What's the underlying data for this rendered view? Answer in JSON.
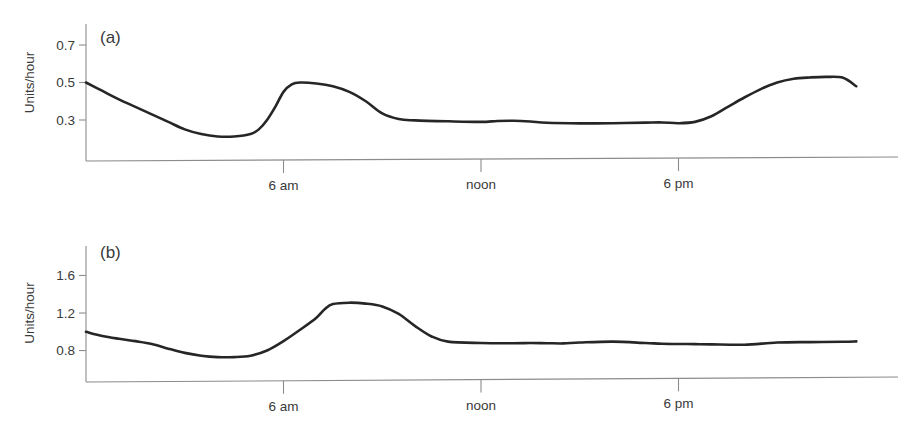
{
  "figure": {
    "width": 904,
    "height": 434,
    "background": "#ffffff",
    "line_color": "#262626",
    "axis_color": "#8c8c8c",
    "text_color": "#3a3a3a"
  },
  "chart_data": [
    {
      "type": "line",
      "panel_label": "(a)",
      "title": "",
      "xlabel": "",
      "ylabel": "Units/hour",
      "grid": false,
      "legend": "none",
      "xtick_labels": [
        "6 am",
        "noon",
        "6 pm"
      ],
      "xtick_values": [
        6,
        12,
        18
      ],
      "xlim": [
        0,
        24
      ],
      "ytick_labels": [
        "0.3",
        "0.5",
        "0.7"
      ],
      "ytick_values": [
        0.3,
        0.5,
        0.7
      ],
      "ylim": [
        0.14,
        0.78
      ],
      "x": [
        0.0,
        0.5,
        1.0,
        1.5,
        2.0,
        2.5,
        3.0,
        3.5,
        4.0,
        4.5,
        5.0,
        5.25,
        5.5,
        5.75,
        6.0,
        6.25,
        6.5,
        7.0,
        7.5,
        8.0,
        8.5,
        9.0,
        9.5,
        10.0,
        11.0,
        12.0,
        12.5,
        13.0,
        13.5,
        14.0,
        15.0,
        16.0,
        17.0,
        17.5,
        18.0,
        18.5,
        19.0,
        19.5,
        20.0,
        20.5,
        21.0,
        21.5,
        22.0,
        22.5,
        23.0,
        23.4
      ],
      "y": [
        0.5,
        0.455,
        0.41,
        0.37,
        0.33,
        0.29,
        0.25,
        0.225,
        0.212,
        0.212,
        0.225,
        0.25,
        0.3,
        0.37,
        0.45,
        0.49,
        0.5,
        0.495,
        0.48,
        0.45,
        0.4,
        0.335,
        0.305,
        0.298,
        0.293,
        0.29,
        0.295,
        0.296,
        0.292,
        0.285,
        0.282,
        0.283,
        0.286,
        0.287,
        0.283,
        0.29,
        0.32,
        0.37,
        0.42,
        0.465,
        0.5,
        0.52,
        0.527,
        0.53,
        0.525,
        0.48
      ]
    },
    {
      "type": "line",
      "panel_label": "(b)",
      "title": "",
      "xlabel": "",
      "ylabel": "Units/hour",
      "grid": false,
      "legend": "none",
      "xtick_labels": [
        "6 am",
        "noon",
        "6 pm"
      ],
      "xtick_values": [
        6,
        12,
        18
      ],
      "xlim": [
        0,
        24
      ],
      "ytick_labels": [
        "0.8",
        "1.2",
        "1.6"
      ],
      "ytick_values": [
        0.8,
        1.2,
        1.6
      ],
      "ylim": [
        0.55,
        1.85
      ],
      "x": [
        0.0,
        0.5,
        1.0,
        1.5,
        2.0,
        2.5,
        3.0,
        3.5,
        4.0,
        4.5,
        5.0,
        5.5,
        6.0,
        6.5,
        7.0,
        7.25,
        7.5,
        8.0,
        8.5,
        9.0,
        9.5,
        10.0,
        10.5,
        11.0,
        12.0,
        13.0,
        13.5,
        14.0,
        14.5,
        15.0,
        16.0,
        17.0,
        17.5,
        18.0,
        18.5,
        19.0,
        20.0,
        21.0,
        22.0,
        23.0,
        23.4
      ],
      "y": [
        1.0,
        0.955,
        0.925,
        0.9,
        0.87,
        0.82,
        0.775,
        0.745,
        0.73,
        0.73,
        0.745,
        0.8,
        0.9,
        1.02,
        1.15,
        1.24,
        1.295,
        1.31,
        1.3,
        1.27,
        1.19,
        1.06,
        0.95,
        0.895,
        0.88,
        0.878,
        0.88,
        0.878,
        0.876,
        0.885,
        0.895,
        0.88,
        0.872,
        0.87,
        0.868,
        0.866,
        0.862,
        0.885,
        0.89,
        0.893,
        0.898
      ]
    }
  ]
}
